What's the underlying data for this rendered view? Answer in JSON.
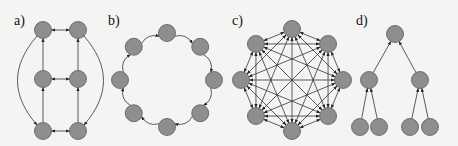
{
  "panels": [
    {
      "label": "a)",
      "label_pos": [
        14,
        25
      ],
      "type": "grid-ladder",
      "nodes": [
        [
          43,
          30
        ],
        [
          78,
          30
        ],
        [
          43,
          79
        ],
        [
          78,
          79
        ],
        [
          43,
          131
        ],
        [
          78,
          131
        ]
      ],
      "edges": [
        {
          "from": 0,
          "to": 1,
          "bidir": true
        },
        {
          "from": 2,
          "to": 3,
          "bidir": true
        },
        {
          "from": 4,
          "to": 5,
          "bidir": true
        },
        {
          "from": 2,
          "to": 0
        },
        {
          "from": 4,
          "to": 2
        },
        {
          "from": 3,
          "to": 1
        },
        {
          "from": 5,
          "to": 3
        }
      ],
      "curves": [
        {
          "from": 0,
          "to": 4,
          "side": "left"
        },
        {
          "from": 1,
          "to": 5,
          "side": "right"
        }
      ]
    },
    {
      "label": "b)",
      "label_pos": [
        108,
        25
      ],
      "type": "ring",
      "center": [
        167,
        80
      ],
      "radius": 47,
      "count": 8
    },
    {
      "label": "c)",
      "label_pos": [
        232,
        25
      ],
      "type": "complete-graph",
      "center": [
        292,
        80
      ],
      "radius": 51,
      "count": 8
    },
    {
      "label": "d)",
      "label_pos": [
        356,
        25
      ],
      "type": "tree",
      "nodes": [
        [
          395,
          34
        ],
        [
          369,
          80
        ],
        [
          420,
          80
        ],
        [
          360,
          127
        ],
        [
          379,
          127
        ],
        [
          410,
          127
        ],
        [
          430,
          127
        ]
      ],
      "edges": [
        {
          "from": 1,
          "to": 0
        },
        {
          "from": 2,
          "to": 0
        },
        {
          "from": 3,
          "to": 1
        },
        {
          "from": 4,
          "to": 1
        },
        {
          "from": 5,
          "to": 2
        },
        {
          "from": 6,
          "to": 2
        }
      ]
    }
  ],
  "style": {
    "node_fill": "#8e8e8e",
    "node_stroke": "#5a5a5a",
    "edge_color": "#333333",
    "node_radius": 8.5
  }
}
